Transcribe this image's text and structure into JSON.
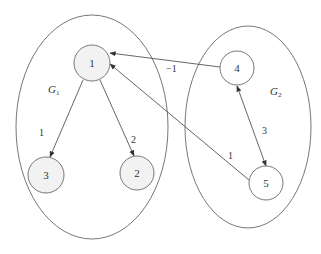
{
  "colors": {
    "stroke": "#777777",
    "edge": "#555555",
    "node_fill_g1": "#f2f2f2",
    "node_fill_g2": "#ffffff",
    "background": "#ffffff"
  },
  "groups": [
    {
      "id": "G1",
      "label": "G",
      "subscript": "1",
      "cx": 92,
      "cy": 127,
      "rx": 76,
      "ry": 112,
      "label_x": 48,
      "label_y": 93
    },
    {
      "id": "G2",
      "label": "G",
      "subscript": "2",
      "cx": 248,
      "cy": 127,
      "rx": 63,
      "ry": 101,
      "label_x": 270,
      "label_y": 95
    }
  ],
  "nodes": [
    {
      "id": "1",
      "label": "1",
      "cx": 92,
      "cy": 63,
      "r": 18,
      "group": "G1"
    },
    {
      "id": "2",
      "label": "2",
      "cx": 137,
      "cy": 173,
      "r": 17,
      "group": "G1"
    },
    {
      "id": "3",
      "label": "3",
      "cx": 46,
      "cy": 175,
      "r": 18,
      "group": "G1"
    },
    {
      "id": "4",
      "label": "4",
      "cx": 237,
      "cy": 68,
      "r": 17,
      "group": "G2"
    },
    {
      "id": "5",
      "label": "5",
      "cx": 266,
      "cy": 183,
      "r": 17,
      "group": "G2"
    }
  ],
  "edges": [
    {
      "from": "1",
      "to": "3",
      "weight": "1",
      "x1": 83,
      "y1": 80,
      "x2": 50,
      "y2": 157,
      "label_x": 39,
      "label_y": 136,
      "bidirectional": false
    },
    {
      "from": "1",
      "to": "2",
      "weight": "2",
      "x1": 100,
      "y1": 80,
      "x2": 134,
      "y2": 156,
      "label_x": 131,
      "label_y": 143,
      "bidirectional": false
    },
    {
      "from": "4",
      "to": "1",
      "weight": "−1",
      "x1": 220,
      "y1": 67,
      "x2": 110,
      "y2": 53,
      "label_x": 166,
      "label_y": 72,
      "bidirectional": false
    },
    {
      "from": "5",
      "to": "1",
      "weight": "1",
      "x1": 249,
      "y1": 180,
      "x2": 110,
      "y2": 64,
      "label_x": 228,
      "label_y": 159,
      "bidirectional": false
    },
    {
      "from": "4",
      "to": "5",
      "weight": "3",
      "x1": 237,
      "y1": 86,
      "x2": 266,
      "y2": 166,
      "label_x": 262,
      "label_y": 134,
      "bidirectional": true
    }
  ]
}
